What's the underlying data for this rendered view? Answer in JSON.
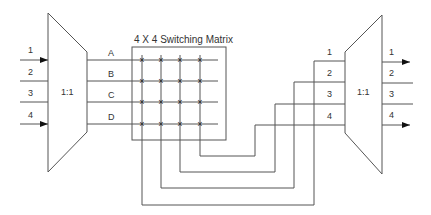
{
  "diagram": {
    "title": "4 X 4 Switching Matrix",
    "left_mux": {
      "label": "1:1",
      "inputs": [
        "1",
        "2",
        "3",
        "4"
      ],
      "outputs": [
        "A",
        "B",
        "C",
        "D"
      ]
    },
    "matrix": {
      "label": "4 X 4 Switching Matrix",
      "rows": [
        "A",
        "B",
        "C",
        "D"
      ],
      "columns": 4,
      "crosspoint_symbol": "×"
    },
    "right_mux": {
      "label": "1:1",
      "inputs": [
        "1",
        "2",
        "3",
        "4"
      ],
      "outputs": [
        "1",
        "2",
        "3",
        "4"
      ]
    },
    "connections": [
      {
        "from": "matrix-column-1",
        "to": "right-input-1"
      },
      {
        "from": "matrix-column-2",
        "to": "right-input-2"
      },
      {
        "from": "matrix-column-3",
        "to": "right-input-3"
      },
      {
        "from": "matrix-column-4",
        "to": "right-input-4"
      }
    ],
    "colors": {
      "line": "#555555",
      "text": "#333333",
      "background": "#ffffff"
    }
  }
}
